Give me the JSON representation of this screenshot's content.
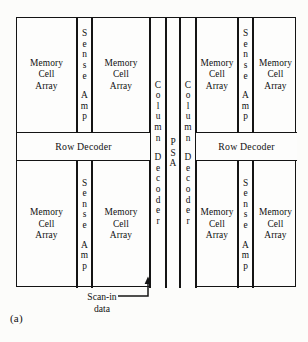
{
  "figure": {
    "caption": "(a)",
    "frame": {
      "x": 16,
      "y": 17,
      "width": 280,
      "height": 270
    }
  },
  "blocks": [
    {
      "name": "memory-cell-array-top-left-1",
      "label": "Memory\nCell\nArray",
      "orientation": "horizontal",
      "x": 0,
      "width": 60,
      "section": "top"
    },
    {
      "name": "sense-amp-top-left",
      "label": "Sense Amp",
      "orientation": "vertical",
      "x": 60,
      "width": 15,
      "section": "top"
    },
    {
      "name": "memory-cell-array-top-left-2",
      "label": "Memory\nCell\nArray",
      "orientation": "horizontal",
      "x": 75,
      "width": 58,
      "section": "top"
    },
    {
      "name": "memory-cell-array-top-right-1",
      "label": "Memory\nCell\nArray",
      "orientation": "horizontal",
      "x": 164,
      "width": 57,
      "section": "top"
    },
    {
      "name": "sense-amp-top-right",
      "label": "Sense Amp",
      "orientation": "vertical",
      "x": 221,
      "width": 15,
      "section": "top"
    },
    {
      "name": "memory-cell-array-top-right-2",
      "label": "Memory\nCell\nArray",
      "orientation": "horizontal",
      "x": 236,
      "width": 44,
      "section": "top"
    },
    {
      "name": "memory-cell-array-bottom-left-1",
      "label": "Memory\nCell\nArray",
      "orientation": "horizontal",
      "x": 0,
      "width": 60,
      "section": "bottom"
    },
    {
      "name": "sense-amp-bottom-left",
      "label": "Sense Amp",
      "orientation": "vertical",
      "x": 60,
      "width": 15,
      "section": "bottom"
    },
    {
      "name": "memory-cell-array-bottom-left-2",
      "label": "Memory\nCell\nArray",
      "orientation": "horizontal",
      "x": 75,
      "width": 58,
      "section": "bottom"
    },
    {
      "name": "memory-cell-array-bottom-right-1",
      "label": "Memory\nCell\nArray",
      "orientation": "horizontal",
      "x": 164,
      "width": 57,
      "section": "bottom"
    },
    {
      "name": "sense-amp-bottom-right",
      "label": "Sense Amp",
      "orientation": "vertical",
      "x": 221,
      "width": 15,
      "section": "bottom"
    },
    {
      "name": "memory-cell-array-bottom-right-2",
      "label": "Memory\nCell\nArray",
      "orientation": "horizontal",
      "x": 236,
      "width": 44,
      "section": "bottom"
    }
  ],
  "center_columns": [
    {
      "name": "column-decoder-left",
      "label": "Column Decoder",
      "x": 133,
      "width": 16
    },
    {
      "name": "psa",
      "label": "PSA",
      "x": 149,
      "width": 14
    },
    {
      "name": "column-decoder-right",
      "label": "Column Decoder",
      "x": 163,
      "width": 16
    }
  ],
  "row_decoders": [
    {
      "name": "row-decoder-left",
      "label": "Row Decoder",
      "x": 0,
      "width": 133
    },
    {
      "name": "row-decoder-right",
      "label": "Row Decoder",
      "x": 179,
      "width": 101
    }
  ],
  "annotations": {
    "scan_in": {
      "label": "Scan-in\ndata",
      "target": "psa",
      "arrow_direction": "up"
    }
  },
  "vertical_text": {
    "sense_amp": [
      "S",
      "e",
      "n",
      "s",
      "e",
      "",
      "A",
      "m",
      "p"
    ],
    "column_decoder": [
      "C",
      "o",
      "l",
      "u",
      "m",
      "n",
      "",
      "D",
      "e",
      "c",
      "o",
      "d",
      "e",
      "r"
    ],
    "psa": [
      "P",
      "S",
      "A"
    ]
  },
  "geometry": {
    "top_section": {
      "y": 0,
      "height": 114
    },
    "row_decoder_band": {
      "y": 114,
      "height": 29
    },
    "bottom_section": {
      "y": 143,
      "height": 127
    }
  },
  "colors": {
    "line": "#141414",
    "background": "#fcfcfa",
    "block_fill": "#fdfdfc",
    "text": "#111111"
  }
}
